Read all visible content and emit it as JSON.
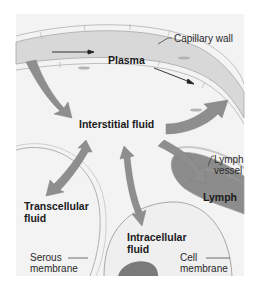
{
  "diagram": {
    "labels": {
      "capillary_wall": "Capillary wall",
      "plasma": "Plasma",
      "interstitial_fluid": "Interstitial fluid",
      "lymph_vessel_line1": "Lymph",
      "lymph_vessel_line2": "vessel",
      "lymph": "Lymph",
      "transcellular_line1": "Transcellular",
      "transcellular_line2": "fluid",
      "intracellular_line1": "Intracellular",
      "intracellular_line2": "fluid",
      "serous_line1": "Serous",
      "serous_line2": "membrane",
      "cell_membrane_line1": "Cell",
      "cell_membrane_line2": "membrane"
    },
    "arrows": [
      {
        "from": "Plasma",
        "to": "Interstitial fluid",
        "type": "one-way"
      },
      {
        "from": "Interstitial fluid",
        "to": "Plasma",
        "type": "one-way"
      },
      {
        "from": "Interstitial fluid",
        "to": "Lymph",
        "type": "one-way"
      },
      {
        "from": "Interstitial fluid",
        "to": "Transcellular fluid",
        "type": "two-way"
      },
      {
        "from": "Interstitial fluid",
        "to": "Intracellular fluid",
        "type": "two-way"
      },
      {
        "from": "Plasma flow",
        "to": "Plasma flow",
        "type": "flow-direction"
      }
    ],
    "colors": {
      "background": "#f3f3f3",
      "plasma_band": "#dcdcdc",
      "arrow": "#8a8a8a",
      "lymph": "#9a9a9a",
      "outline": "#9c9c9c"
    }
  }
}
